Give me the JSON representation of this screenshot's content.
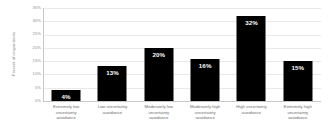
{
  "chart_data": {
    "type": "bar",
    "title": "",
    "xlabel": "",
    "ylabel": "Percent of respondents",
    "ylim": [
      0,
      35
    ],
    "grid": true,
    "legend": false,
    "categories": [
      "Extremely low uncertainty avoidance",
      "Low uncertainty avoidance",
      "Moderately low uncertainty avoidance",
      "Moderately high uncertainty avoidance",
      "High uncertainty avoidance",
      "Extremely high uncertainty avoidance"
    ],
    "category_lines": [
      [
        "Extremely low",
        "uncertainty",
        "avoidance"
      ],
      [
        "Low uncertainty",
        "avoidance"
      ],
      [
        "Moderately low",
        "uncertainty",
        "avoidance"
      ],
      [
        "Moderately high",
        "uncertainty",
        "avoidance"
      ],
      [
        "High uncertainty",
        "avoidance"
      ],
      [
        "Extremely high",
        "uncertainty",
        "avoidance"
      ]
    ],
    "values": [
      4,
      13,
      20,
      16,
      32,
      15
    ],
    "value_labels": [
      "4%",
      "13%",
      "20%",
      "16%",
      "32%",
      "15%"
    ],
    "y_ticks": [
      0,
      5,
      10,
      15,
      20,
      25,
      30,
      35
    ],
    "y_tick_labels": [
      "0%",
      "5%",
      "10%",
      "15%",
      "20%",
      "25%",
      "30%",
      "35%"
    ],
    "bar_color": "#000000",
    "label_color": "#ffffff",
    "grid_color": "#e9e9e9",
    "axis_color": "#c9c9c9",
    "tick_text_color": "#8f8f8f",
    "background_color": "#ffffff"
  }
}
